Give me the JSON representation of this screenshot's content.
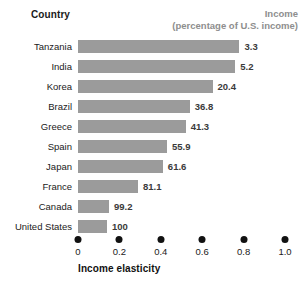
{
  "header": {
    "country_label": "Country",
    "income_label": "Income",
    "income_sublabel": "(percentage of U.S. income)"
  },
  "axis": {
    "title": "Income elasticity",
    "tick_labels": [
      "0",
      "0.2",
      "0.4",
      "0.6",
      "0.8",
      "1.0"
    ]
  },
  "colors": {
    "bar": "#9b9b9b",
    "header_muted": "#8e8e8e",
    "text": "#1a1a1a",
    "tick_dot": "#111111"
  },
  "chart_data": {
    "type": "bar",
    "orientation": "horizontal",
    "title": "",
    "xlabel": "Income elasticity",
    "ylabel": "Country",
    "xlim": [
      0,
      1.0
    ],
    "xticks": [
      0,
      0.2,
      0.4,
      0.6,
      0.8,
      1.0
    ],
    "grid": false,
    "legend": "none",
    "categories": [
      "Tanzania",
      "India",
      "Korea",
      "Brazil",
      "Greece",
      "Spain",
      "Japan",
      "France",
      "Canada",
      "United States"
    ],
    "values": [
      0.78,
      0.76,
      0.65,
      0.54,
      0.52,
      0.43,
      0.41,
      0.29,
      0.15,
      0.14
    ],
    "data_labels": [
      "3.3",
      "5.2",
      "20.4",
      "36.8",
      "41.3",
      "55.9",
      "61.6",
      "81.1",
      "99.2",
      "100"
    ],
    "data_label_header": "Income (percentage of U.S. income)",
    "data_label_values": [
      3.3,
      5.2,
      20.4,
      36.8,
      41.3,
      55.9,
      61.6,
      81.1,
      99.2,
      100
    ],
    "annotations": []
  }
}
